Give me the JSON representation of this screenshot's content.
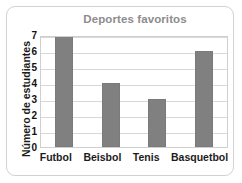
{
  "chart_data": {
    "type": "bar",
    "title": "Deportes favoritos",
    "xlabel": "",
    "ylabel": "Número de estudiantes",
    "categories": [
      "Futbol",
      "Beisbol",
      "Tenis",
      "Basquetbol"
    ],
    "values": [
      7,
      4,
      3,
      6
    ],
    "ylim": [
      0,
      7
    ],
    "yticks": [
      7,
      6,
      5,
      4,
      3,
      2,
      1,
      0
    ],
    "grid": true,
    "legend": null,
    "bar_color": "#808080",
    "title_color": "#8c8c8c",
    "axis_text_color": "#1c1c1c",
    "gridline_color": "#d8d8d8",
    "plot_border_color": "#cfcfcf",
    "plot_background": "#ffffff"
  }
}
